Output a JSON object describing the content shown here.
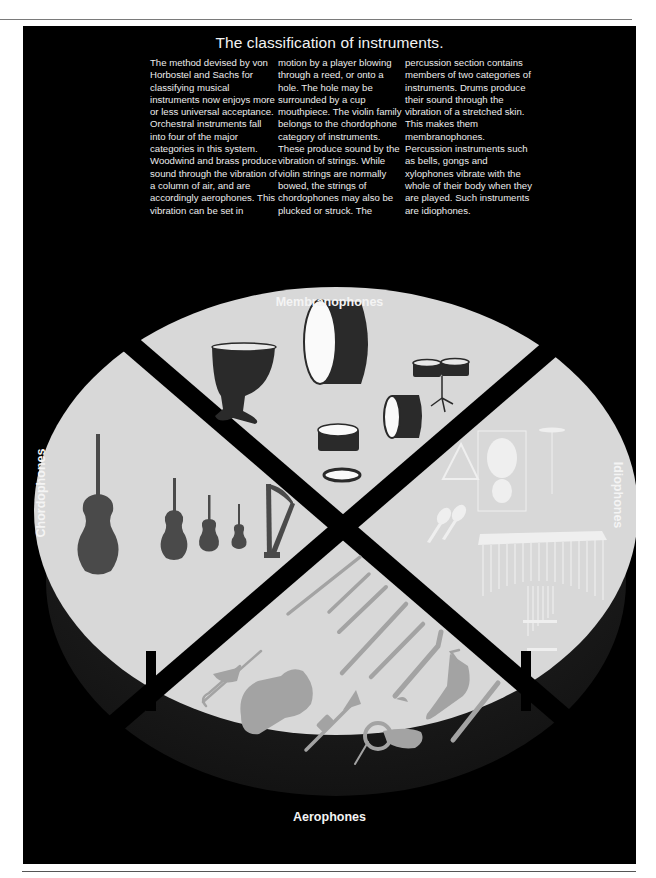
{
  "page": {
    "title": "The classification of instruments.",
    "columns": [
      "The method devised by von Horbostel and Sachs for classifying musical instruments now enjoys more or less universal acceptance. Orchestral instruments fall into four of the major categories in this system. Woodwind and brass produce sound through the vibration of a column of air, and are accordingly aerophones. This vibration can be set in",
      "motion by a player blowing through a reed, or onto a hole. The hole may be surrounded by a cup mouthpiece. The violin family belongs to the chordophone category of instruments. These produce sound by the vibration of strings. While violin strings are normally bowed, the strings of chordophones may also be plucked or struck. The",
      "percussion section contains members of two categories of instruments. Drums produce their sound through the vibration of a stretched skin. This makes them membranophones. Percussion instruments such as bells, gongs and xylophones vibrate with the whole of their body when they are played. Such instruments are idiophones."
    ]
  },
  "diagram": {
    "labels": {
      "top": "Membranophones",
      "left": "Chordophones",
      "right": "Idiophones",
      "bottom": "Aerophones"
    },
    "quadrants": [
      {
        "name": "Membranophones",
        "instruments": [
          "timpani",
          "bass drum",
          "bongos on stand",
          "tom-tom",
          "snare drum",
          "tambourine"
        ]
      },
      {
        "name": "Chordophones",
        "instruments": [
          "double bass",
          "cello",
          "viola",
          "violin",
          "harp"
        ]
      },
      {
        "name": "Idiophones",
        "instruments": [
          "gong",
          "cymbal",
          "triangle",
          "maracas",
          "xylophone",
          "tubular bells"
        ]
      },
      {
        "name": "Aerophones",
        "instruments": [
          "flute",
          "piccolo",
          "oboe",
          "clarinet",
          "cor anglais",
          "bass clarinet",
          "saxophone",
          "bassoon",
          "trombone",
          "tuba",
          "trumpet",
          "french horn"
        ]
      }
    ]
  },
  "colors": {
    "background": "#000000",
    "disc": "#d9d9d9",
    "disc_side": "#1c1c1c",
    "dark_silhouette": "#2c2c2c",
    "string_silhouette": "#4a4a4a",
    "wind_silhouette": "#a3a3a3",
    "idio_silhouette": "#efefef",
    "text": "#ececec"
  }
}
